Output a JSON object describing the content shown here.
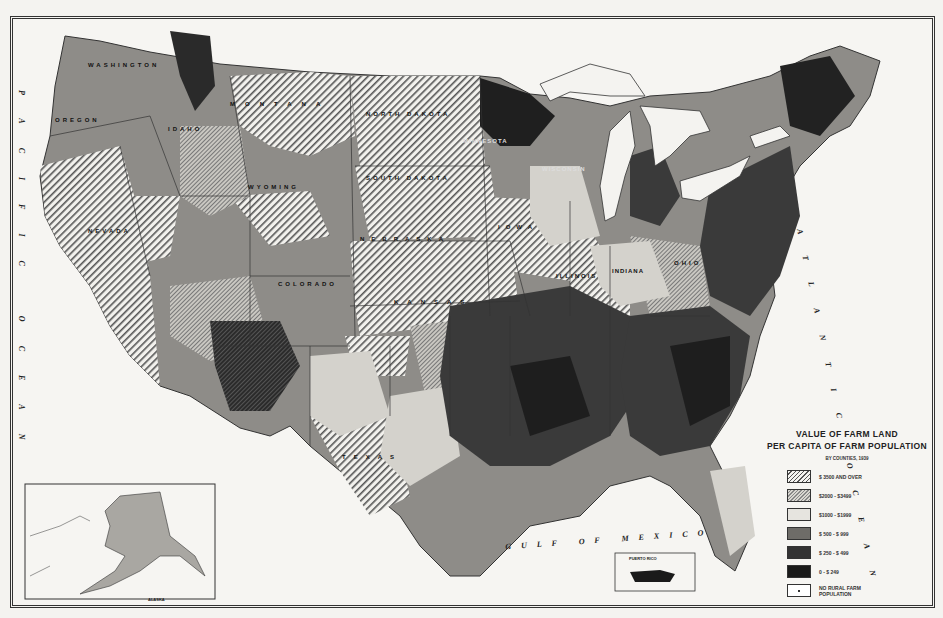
{
  "page_header": "Value of Farm Land Per Capita of Farm Population, 1939",
  "legend": {
    "title_line1": "VALUE OF FARM LAND",
    "title_line2": "PER CAPITA OF FARM POPULATION",
    "subtitle": "BY COUNTIES, 1939",
    "items": [
      {
        "label": "$ 3500 AND OVER",
        "pattern": "wide-hatch"
      },
      {
        "label": "$2000  -  $3499",
        "pattern": "fine-hatch"
      },
      {
        "label": "$1000  -  $1999",
        "pattern": "light-stipple"
      },
      {
        "label": "$ 500  -  $ 999",
        "pattern": "medium-gray"
      },
      {
        "label": "$ 250  -  $ 499",
        "pattern": "dark-gray"
      },
      {
        "label": "0  -  $ 249",
        "pattern": "black"
      },
      {
        "label": "NO RURAL FARM POPULATION",
        "pattern": "blank-dot"
      }
    ]
  },
  "ocean_labels": {
    "pacific": "PACIFIC OCEAN",
    "atlantic": "ATLANTIC OCEAN",
    "gulf": "GULF OF MEXICO"
  },
  "state_labels": [
    {
      "name": "WASHINGTON",
      "x": 92,
      "y": 64
    },
    {
      "name": "OREGON",
      "x": 58,
      "y": 120
    },
    {
      "name": "IDAHO",
      "x": 172,
      "y": 128
    },
    {
      "name": "MONTANA",
      "x": 233,
      "y": 103
    },
    {
      "name": "NORTH DAKOTA",
      "x": 369,
      "y": 113
    },
    {
      "name": "SOUTH DAKOTA",
      "x": 369,
      "y": 177
    },
    {
      "name": "WYOMING",
      "x": 250,
      "y": 186
    },
    {
      "name": "NEBRASKA",
      "x": 363,
      "y": 238
    },
    {
      "name": "IOWA",
      "x": 500,
      "y": 226
    },
    {
      "name": "NEVADA",
      "x": 90,
      "y": 230
    },
    {
      "name": "COLORADO",
      "x": 280,
      "y": 283
    },
    {
      "name": "KANSAS",
      "x": 396,
      "y": 301
    },
    {
      "name": "ILLINOIS",
      "x": 558,
      "y": 275
    },
    {
      "name": "INDIANA",
      "x": 610,
      "y": 270
    },
    {
      "name": "OHIO",
      "x": 676,
      "y": 262
    },
    {
      "name": "MINNESOTA",
      "x": 465,
      "y": 140
    },
    {
      "name": "WISCONSIN",
      "x": 545,
      "y": 168
    },
    {
      "name": "TEXAS",
      "x": 345,
      "y": 456
    }
  ],
  "insets": {
    "alaska": {
      "label": "ALASKA"
    },
    "puerto_rico": {
      "label": "PUERTO RICO"
    }
  },
  "colors": {
    "paper": "#f4f3f0",
    "ink": "#222222",
    "class_3500_plus": "#f4f3f0",
    "class_2000_3499": "#b8b6b0",
    "class_1000_1999": "#d8d6d0",
    "class_500_999": "#6e6c68",
    "class_250_499": "#3a3a3a",
    "class_0_249": "#1a1a1a"
  }
}
